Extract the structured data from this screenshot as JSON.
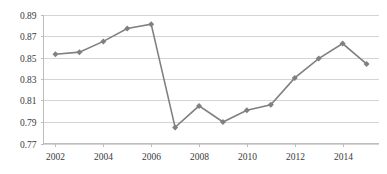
{
  "chart_data": {
    "type": "line",
    "title": "",
    "xlabel": "",
    "ylabel": "",
    "x": [
      2002,
      2003,
      2004,
      2005,
      2006,
      2007,
      2008,
      2009,
      2010,
      2011,
      2012,
      2013,
      2014,
      2015
    ],
    "values": [
      0.853,
      0.855,
      0.865,
      0.877,
      0.881,
      0.785,
      0.805,
      0.79,
      0.801,
      0.806,
      0.831,
      0.849,
      0.863,
      0.844
    ],
    "series": [
      {
        "name": "series-1",
        "values": [
          0.853,
          0.855,
          0.865,
          0.877,
          0.881,
          0.785,
          0.805,
          0.79,
          0.801,
          0.806,
          0.831,
          0.849,
          0.863,
          0.844
        ]
      }
    ],
    "ylim": [
      0.77,
      0.89
    ],
    "xlim": [
      2001.5,
      2015.5
    ],
    "y_ticks": [
      0.77,
      0.79,
      0.81,
      0.83,
      0.85,
      0.87,
      0.89
    ],
    "y_tick_labels": [
      "0.77",
      "0.79",
      "0.81",
      "0.83",
      "0.85",
      "0.87",
      "0.89"
    ],
    "x_ticks": [
      2002,
      2004,
      2006,
      2008,
      2010,
      2012,
      2014
    ],
    "x_tick_labels": [
      "2002",
      "2004",
      "2006",
      "2008",
      "2010",
      "2012",
      "2014"
    ],
    "grid": true,
    "grid_axis": "y",
    "legend": false,
    "legend_position": "none",
    "marker": "diamond",
    "colors": {
      "line": "#808080",
      "marker": "#808080",
      "gridline": "#d4d4d4",
      "axis": "#bdbdbd",
      "tick_text": "#3a3a3a",
      "background": "#ffffff"
    }
  }
}
